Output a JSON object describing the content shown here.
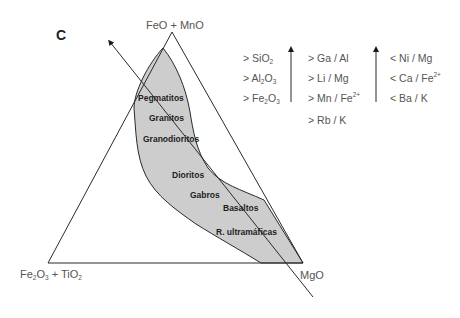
{
  "panel_label": "C",
  "vertices": {
    "top": {
      "base": "FeO + MnO"
    },
    "left": {
      "parts": [
        "Fe",
        "2",
        "O",
        "3",
        " + TiO",
        "2"
      ]
    },
    "right": {
      "base": "MgO"
    }
  },
  "rock_types": [
    "Pegmatitos",
    "Granitos",
    "Granodioritos",
    "Dioritos",
    "Gabros",
    "Basaltos",
    "R. ultramáficas"
  ],
  "legend": {
    "column1": [
      {
        "prefix": "> ",
        "parts": [
          "SiO",
          "2"
        ]
      },
      {
        "prefix": "> ",
        "parts": [
          "Al",
          "2",
          "O",
          "3"
        ]
      },
      {
        "prefix": "> ",
        "parts": [
          "Fe",
          "2",
          "O",
          "3"
        ]
      }
    ],
    "column2": [
      {
        "text": "> Ga / Al"
      },
      {
        "text": "> Li / Mg"
      },
      {
        "text": "> Mn / Fe",
        "sup": "2+"
      },
      {
        "text": "> Rb / K"
      }
    ],
    "column3": [
      {
        "text": "< Ni / Mg"
      },
      {
        "text": "< Ca / Fe",
        "sup": "2+"
      },
      {
        "text": "< Ba / K"
      }
    ],
    "arrows": [
      "increase-arrow-1",
      "increase-arrow-2"
    ]
  },
  "colors": {
    "field_fill": "#cdcdcd",
    "lines": "#2a2a2a",
    "text": "#555555"
  }
}
